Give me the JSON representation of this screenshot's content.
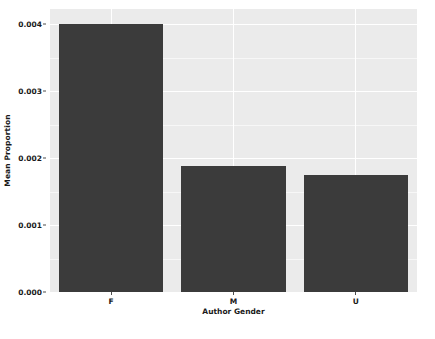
{
  "chart_data": {
    "type": "bar",
    "title": "",
    "xlabel": "Author Gender",
    "ylabel": "Mean Proportion",
    "categories": [
      "F",
      "M",
      "U"
    ],
    "values": [
      0.004,
      0.00188,
      0.00175
    ],
    "ylim": [
      0.0,
      0.004
    ],
    "yticks": [
      "0.000",
      "0.001",
      "0.002",
      "0.003",
      "0.004"
    ],
    "ytick_values": [
      0.0,
      0.001,
      0.002,
      0.003,
      0.004
    ],
    "grid": true,
    "legend": "none",
    "bar_color": "#3b3b3b",
    "panel_color": "#ebebeb",
    "gridline_color": "#ffffff",
    "axis_text_color": "#1a1a1a"
  }
}
